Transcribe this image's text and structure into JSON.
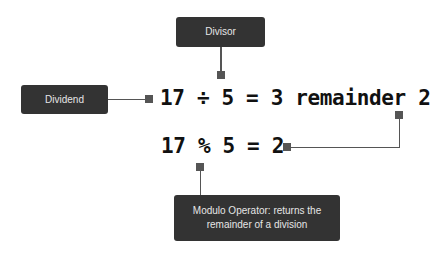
{
  "labels": {
    "divisor": "Divisor",
    "dividend": "Dividend",
    "modulo": "Modulo Operator: returns the remainder of a division"
  },
  "equations": {
    "division": "17 ÷ 5 = 3 remainder 2",
    "modulo": "17 % 5 = 2"
  },
  "colors": {
    "box_bg": "#333333",
    "box_text": "#e6e6e6",
    "connector": "#555555",
    "equation_text": "#111111"
  }
}
